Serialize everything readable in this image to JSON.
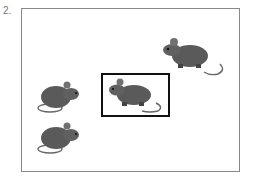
{
  "question": {
    "number_label": "2."
  },
  "figure": {
    "mice": [
      {
        "id": "mouse-top-right",
        "facing": "left"
      },
      {
        "id": "mouse-center-selected",
        "facing": "left",
        "selected": true
      },
      {
        "id": "mouse-left-upper",
        "facing": "right"
      },
      {
        "id": "mouse-left-lower",
        "facing": "right"
      }
    ],
    "colors": {
      "mouse_body": "#555555",
      "frame": "#888888",
      "selection": "#111111"
    }
  }
}
